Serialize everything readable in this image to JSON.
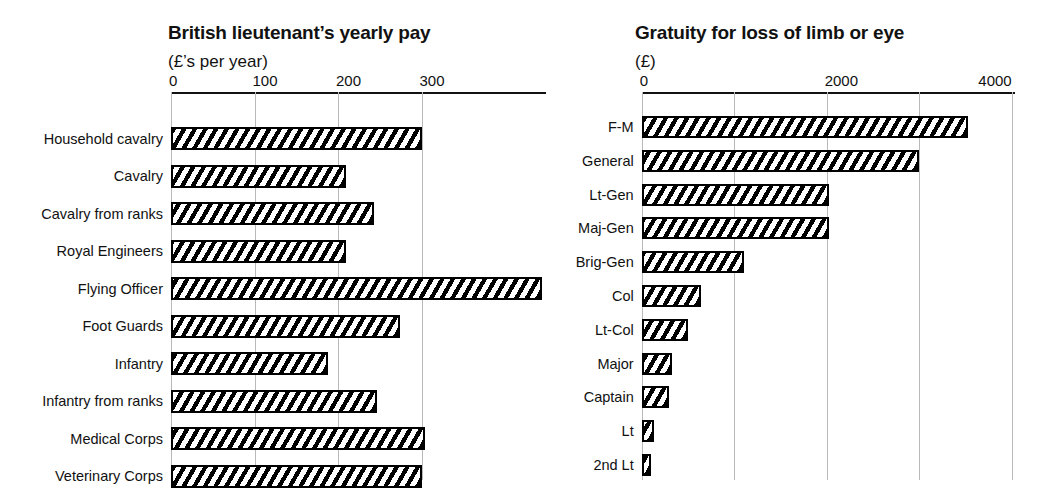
{
  "chart_data": [
    {
      "type": "bar",
      "orientation": "horizontal",
      "title": "British lieutenant’s yearly pay",
      "subtitle": "(£’s per year)",
      "xlabel": "",
      "ylabel": "",
      "xlim": [
        0,
        400
      ],
      "ticks": [
        0,
        100,
        200,
        300
      ],
      "tick_labels": [
        "0",
        "100",
        "200",
        "300"
      ],
      "grid": true,
      "legend": "none",
      "categories": [
        "Household cavalry",
        "Cavalry",
        "Cavalry from ranks",
        "Royal Engineers",
        "Flying Officer",
        "Foot Guards",
        "Infantry",
        "Infantry from ranks",
        "Medical Corps",
        "Veterinary Corps"
      ],
      "values": [
        300,
        209,
        243,
        209,
        444,
        274,
        188,
        247,
        304,
        300
      ]
    },
    {
      "type": "bar",
      "orientation": "horizontal",
      "title": "Gratuity for loss of limb or eye",
      "subtitle": "(£)",
      "xlabel": "",
      "ylabel": "",
      "xlim": [
        0,
        4000
      ],
      "ticks": [
        0,
        2000,
        4000
      ],
      "tick_labels": [
        "0",
        "2000",
        "4000"
      ],
      "minor_ticks": [
        1000,
        3000
      ],
      "grid": true,
      "legend": "none",
      "categories": [
        "F-M",
        "General",
        "Lt-Gen",
        "Maj-Gen",
        "Brig-Gen",
        "Col",
        "Lt-Col",
        "Major",
        "Captain",
        "Lt",
        "2nd Lt"
      ],
      "values": [
        3530,
        3000,
        2030,
        2030,
        1110,
        640,
        505,
        330,
        290,
        135,
        100
      ]
    }
  ],
  "style": {
    "bar_outline": "#000000",
    "bar_fill": "#ffffff",
    "hatch": "diagonal",
    "gridline_color": "#b9b9bb",
    "axis_color": "#111111",
    "background": "#ffffff"
  }
}
